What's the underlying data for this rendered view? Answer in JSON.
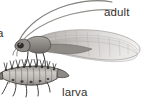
{
  "figure": {
    "kind": "scientific-illustration",
    "background_color": "#ffffff",
    "label_color": "#33302e",
    "width": 148,
    "height": 106
  },
  "labels": {
    "adult": "adult",
    "larva": "larva",
    "edge_fragment": "a"
  },
  "specimens": [
    {
      "id": "adult-insect",
      "name": "adult",
      "parts": [
        "antenna-upper",
        "antenna-lower",
        "head",
        "eye",
        "thorax",
        "abdomen",
        "forewing",
        "hindwing",
        "leg-front",
        "leg-middle",
        "leg-hind"
      ],
      "body_color": "#8b8884",
      "wing_color": "#c9c7c4",
      "outline_color": "#4a4744"
    },
    {
      "id": "larva-insect",
      "name": "larva",
      "parts": [
        "head",
        "mandibles",
        "segmented-body",
        "dorsal-spines",
        "lateral-tubercles",
        "legs",
        "tail-tip"
      ],
      "body_color": "#b8b5b1",
      "outline_color": "#3f3c3a",
      "segment_count": 10
    }
  ]
}
